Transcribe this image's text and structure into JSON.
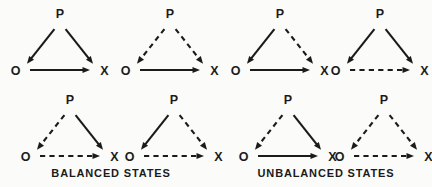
{
  "figure": {
    "title": "",
    "node_labels": {
      "p": "P",
      "o": "O",
      "x": "X"
    },
    "line_color": "#1b1b1b",
    "background_color": "#fbfbfa"
  },
  "groups": [
    {
      "id": "balanced",
      "caption": "BALANCED STATES",
      "triangles": [
        {
          "id": "balanced-1",
          "p": "P",
          "o": "O",
          "x": "X",
          "edges": {
            "p_to_o": "solid",
            "p_to_x": "solid",
            "o_to_x": "solid"
          }
        },
        {
          "id": "balanced-2",
          "p": "P",
          "o": "O",
          "x": "X",
          "edges": {
            "p_to_o": "dashed",
            "p_to_x": "dashed",
            "o_to_x": "solid"
          }
        },
        {
          "id": "balanced-3",
          "p": "P",
          "o": "O",
          "x": "X",
          "edges": {
            "p_to_o": "dashed",
            "p_to_x": "solid",
            "o_to_x": "dashed"
          }
        },
        {
          "id": "balanced-4",
          "p": "P",
          "o": "O",
          "x": "X",
          "edges": {
            "p_to_o": "solid",
            "p_to_x": "dashed",
            "o_to_x": "dashed"
          }
        }
      ]
    },
    {
      "id": "unbalanced",
      "caption": "UNBALANCED STATES",
      "triangles": [
        {
          "id": "unbalanced-1",
          "p": "P",
          "o": "O",
          "x": "X",
          "edges": {
            "p_to_o": "solid",
            "p_to_x": "dashed",
            "o_to_x": "solid"
          }
        },
        {
          "id": "unbalanced-2",
          "p": "P",
          "o": "O",
          "x": "X",
          "edges": {
            "p_to_o": "solid",
            "p_to_x": "solid",
            "o_to_x": "dashed"
          }
        },
        {
          "id": "unbalanced-3",
          "p": "P",
          "o": "O",
          "x": "X",
          "edges": {
            "p_to_o": "dashed",
            "p_to_x": "solid",
            "o_to_x": "solid"
          }
        },
        {
          "id": "unbalanced-4",
          "p": "P",
          "o": "O",
          "x": "X",
          "edges": {
            "p_to_o": "dashed",
            "p_to_x": "dashed",
            "o_to_x": "dashed"
          }
        }
      ]
    }
  ],
  "layout": {
    "rows": [
      {
        "top": 8,
        "cells": [
          {
            "group": 0,
            "index": 0,
            "left": 12
          },
          {
            "group": 0,
            "index": 1,
            "left": 122
          },
          {
            "group": 1,
            "index": 0,
            "left": 232
          },
          {
            "group": 1,
            "index": 1,
            "left": 332
          }
        ]
      },
      {
        "top": 94,
        "cells": [
          {
            "group": 0,
            "index": 2,
            "left": 22
          },
          {
            "group": 0,
            "index": 3,
            "left": 126
          },
          {
            "group": 1,
            "index": 2,
            "left": 240
          },
          {
            "group": 1,
            "index": 3,
            "left": 336
          }
        ]
      }
    ]
  }
}
